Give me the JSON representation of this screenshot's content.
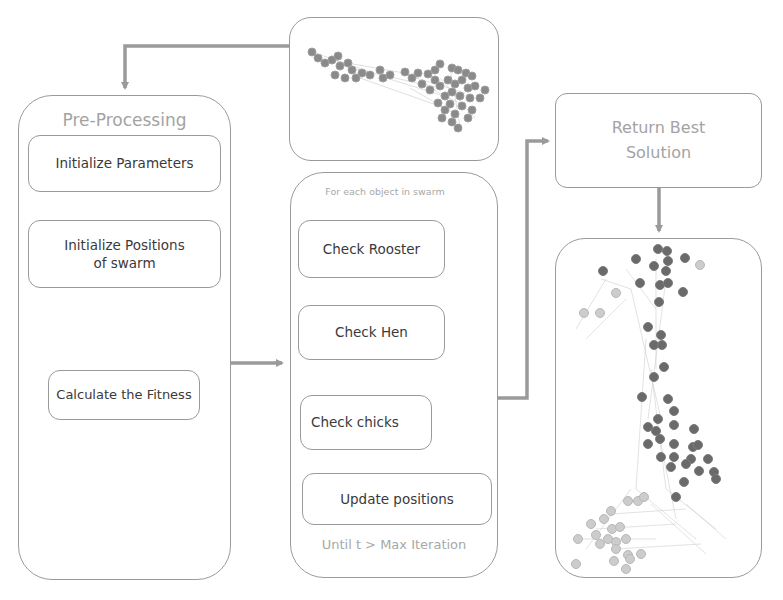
{
  "preprocessing": {
    "title": "Pre-Processing",
    "steps": [
      {
        "label": "Initialize Parameters"
      },
      {
        "label": "Initialize Positions of swarm"
      },
      {
        "label": "Calculate the Fitness"
      }
    ]
  },
  "loop": {
    "header": "For each object in swarm",
    "steps": [
      {
        "label": "Check Rooster"
      },
      {
        "label": "Check Hen"
      },
      {
        "label": "Check chicks"
      },
      {
        "label": "Update positions"
      }
    ],
    "footer": "Until t > Max Iteration"
  },
  "result": {
    "title": "Return Best Solution"
  },
  "graphs": {
    "initial": {
      "description": "initial-swarm-network-graph"
    },
    "final": {
      "description": "best-solution-community-graph"
    }
  },
  "colors": {
    "border": "#9a9a9a",
    "arrow": "#9a9a9a",
    "title_text": "#a3a3a3",
    "step_text": "#3a3a3a",
    "node_dark": "#6e6e6e",
    "node_light": "#c8c8c8"
  }
}
